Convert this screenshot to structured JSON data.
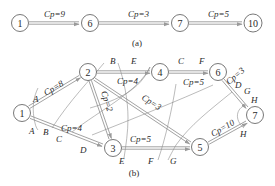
{
  "diagram_a": {
    "caption": "(a)",
    "nodes": [
      {
        "id": "1",
        "label": "1",
        "x": 20,
        "y": 23
      },
      {
        "id": "6",
        "label": "6",
        "x": 90,
        "y": 23
      },
      {
        "id": "7",
        "label": "7",
        "x": 180,
        "y": 23
      },
      {
        "id": "10",
        "label": "10",
        "x": 253,
        "y": 23
      }
    ],
    "edges": [
      {
        "from": "1",
        "to": "6",
        "label": "Cp=9"
      },
      {
        "from": "6",
        "to": "7",
        "label": "Cp=3"
      },
      {
        "from": "7",
        "to": "10",
        "label": "Cp=5"
      }
    ]
  },
  "diagram_b": {
    "caption": "(b)",
    "nodes": [
      {
        "id": "1",
        "label": "1",
        "x": 22,
        "y": 113
      },
      {
        "id": "2",
        "label": "2",
        "x": 88,
        "y": 72
      },
      {
        "id": "3",
        "label": "3",
        "x": 113,
        "y": 148
      },
      {
        "id": "4",
        "label": "4",
        "x": 160,
        "y": 72
      },
      {
        "id": "5",
        "label": "5",
        "x": 200,
        "y": 147
      },
      {
        "id": "6",
        "label": "6",
        "x": 218,
        "y": 72
      },
      {
        "id": "7",
        "label": "7",
        "x": 255,
        "y": 115
      }
    ],
    "edges": [
      {
        "from": "1",
        "to": "2",
        "label": "Cp=8"
      },
      {
        "from": "1",
        "to": "3",
        "label": "Cp=4"
      },
      {
        "from": "2",
        "to": "3",
        "label": "Cp=2"
      },
      {
        "from": "2",
        "to": "4",
        "label": "Cp=4"
      },
      {
        "from": "2",
        "to": "5",
        "label": "Cp=3"
      },
      {
        "from": "3",
        "to": "5",
        "label": "Cp=5"
      },
      {
        "from": "4",
        "to": "6",
        "label": "Cp=5"
      },
      {
        "from": "6",
        "to": "7",
        "label": "Cp=3"
      },
      {
        "from": "5",
        "to": "7",
        "label": "Cp=10"
      }
    ],
    "cuts": [
      {
        "name": "A",
        "labels": [
          "A",
          "A"
        ]
      },
      {
        "name": "B",
        "labels": [
          "B",
          "B"
        ]
      },
      {
        "name": "C",
        "labels": [
          "C",
          "C"
        ]
      },
      {
        "name": "D",
        "labels": [
          "D",
          "D"
        ]
      },
      {
        "name": "E",
        "labels": [
          "E",
          "E"
        ]
      },
      {
        "name": "F",
        "labels": [
          "F",
          "F"
        ]
      },
      {
        "name": "G",
        "labels": [
          "G",
          "G"
        ]
      },
      {
        "name": "H",
        "labels": [
          "H",
          "H"
        ]
      }
    ]
  }
}
